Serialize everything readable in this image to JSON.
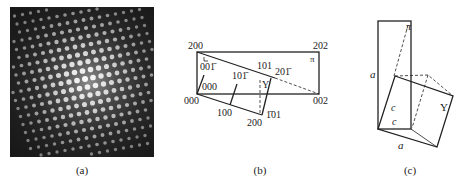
{
  "figure": {
    "panels": [
      {
        "id": "a",
        "caption": "(a)",
        "description": "Electron diffraction pattern: bright spot array on dark background"
      },
      {
        "id": "b",
        "caption": "(b)",
        "labels": {
          "p200_top": "200",
          "p202": "202",
          "pi": "π",
          "p001": "001̄",
          "p101bar": "101̄",
          "p101": "101",
          "p201bar": "201̄",
          "Y": "Y",
          "p000_inner": "000",
          "p000": "000",
          "p002": "002",
          "p100": "100",
          "p200_bottom": "200",
          "pbar101": "1̄01"
        }
      },
      {
        "id": "c",
        "caption": "(c)",
        "labels": {
          "pi": "π",
          "a_left": "a",
          "c_upper": "c",
          "c_lower": "c",
          "a_bottom": "a",
          "Y": "Y"
        }
      }
    ]
  }
}
